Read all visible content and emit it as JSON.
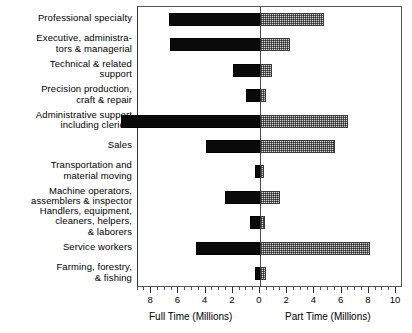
{
  "chart_data": {
    "type": "bar",
    "orientation": "horizontal",
    "style": "diverging-bidirectional",
    "title": "",
    "xlabel_left": "Full Time (Millions)",
    "xlabel_right": "Part Time (Millions)",
    "ylabel": "",
    "grid": false,
    "legend": "none",
    "axis_left_range": [
      10,
      0
    ],
    "axis_right_range": [
      0,
      10
    ],
    "tick_labels_left": [
      "10",
      "8",
      "6",
      "4",
      "2"
    ],
    "tick_labels_center": "0",
    "tick_labels_right": [
      "2",
      "4",
      "6",
      "8",
      "10"
    ],
    "tick_step_major": 2,
    "tick_step_minor": 0.5,
    "categories": [
      "Professional specialty",
      "Executive, administra-\ntors & managerial",
      "Technical & related\nsupport",
      "Precision production,\ncraft & repair",
      "Administrative support\nincluding clerical",
      "Sales",
      "Transportation and\nmaterial moving",
      "Machine operators,\nassemblers & inspector",
      "Handlers, equipment,\ncleaners, helpers,\n& laborers",
      "Service workers",
      "Farming, forestry,\n& fishing"
    ],
    "series": [
      {
        "name": "Full Time (Millions)",
        "direction": "left",
        "color": "#0a0a0a",
        "fill": "solid-black",
        "values": [
          6.7,
          6.6,
          2.0,
          1.0,
          10.2,
          4.0,
          0.35,
          2.6,
          0.75,
          4.7,
          0.4
        ]
      },
      {
        "name": "Part Time (Millions)",
        "direction": "right",
        "color": "#d2d2d2",
        "fill": "checkered-gray",
        "values": [
          4.7,
          2.2,
          0.9,
          0.45,
          6.5,
          5.5,
          0.3,
          1.5,
          0.35,
          8.1,
          0.45
        ]
      }
    ]
  },
  "axis": {
    "left_title": "Full Time (Millions)",
    "right_title": "Part Time (Millions)"
  }
}
